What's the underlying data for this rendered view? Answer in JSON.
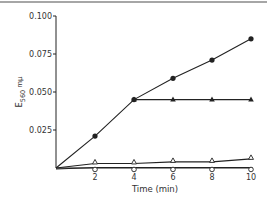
{
  "chart_data": {
    "type": "line",
    "title": "",
    "xlabel": "Time (min)",
    "ylabel": "E",
    "ylabel_subscript": "560",
    "ylabel_unit": "mμ",
    "xlim": [
      0,
      10
    ],
    "ylim": [
      0,
      0.1
    ],
    "x_ticks": [
      2,
      4,
      6,
      8,
      10
    ],
    "x_tick_labels": [
      "2",
      "4",
      "6",
      "8",
      "10"
    ],
    "y_ticks": [
      0.025,
      0.05,
      0.075,
      0.1
    ],
    "y_tick_labels": [
      "0.025",
      "0.050",
      "0.075",
      "0.100"
    ],
    "grid": false,
    "legend": null,
    "series": [
      {
        "name": "filled-circles",
        "marker": "filled-circle",
        "x": [
          0,
          2,
          4,
          6,
          8,
          10
        ],
        "values": [
          0,
          0.021,
          0.045,
          0.059,
          0.071,
          0.085
        ]
      },
      {
        "name": "filled-triangles",
        "marker": "filled-triangle",
        "x": [
          4,
          6,
          8,
          10
        ],
        "values": [
          0.045,
          0.045,
          0.045,
          0.045
        ]
      },
      {
        "name": "open-triangles",
        "marker": "open-triangle",
        "x": [
          0,
          2,
          4,
          6,
          8,
          10
        ],
        "values": [
          0,
          0.003,
          0.003,
          0.004,
          0.004,
          0.006
        ]
      },
      {
        "name": "open-circles",
        "marker": "open-circle",
        "x": [
          0,
          2,
          4,
          6,
          8,
          10
        ],
        "values": [
          0,
          0.001,
          0.001,
          0.001,
          0.001,
          0.001
        ]
      }
    ]
  }
}
